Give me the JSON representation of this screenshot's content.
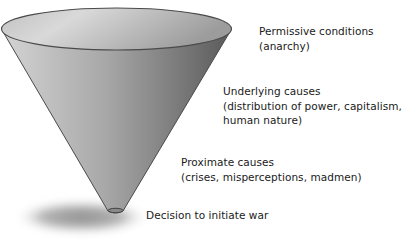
{
  "diagram": {
    "type": "funnel",
    "colors": {
      "rim_light": "#dcdcdc",
      "rim_dark": "#9a9a9a",
      "body_light": "#cfcfcf",
      "body_dark": "#5e5e5e",
      "outline": "#4a4a4a",
      "shadow": "#8c8c8c",
      "text": "#1a1a1a"
    },
    "levels": [
      {
        "id": "permissive",
        "title": "Permissive conditions",
        "detail": "(anarchy)"
      },
      {
        "id": "underlying",
        "title": "Underlying causes",
        "detail_line1": "(distribution of power, capitalism,",
        "detail_line2": "human nature)"
      },
      {
        "id": "proximate",
        "title": "Proximate causes",
        "detail": "(crises, misperceptions, madmen)"
      },
      {
        "id": "decision",
        "title": "Decision to initiate war"
      }
    ]
  }
}
